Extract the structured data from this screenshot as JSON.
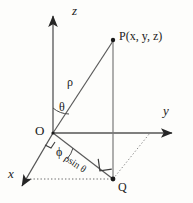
{
  "diagram": {
    "background_color": "#fdfdfb",
    "stroke_color": "#3a3a3a",
    "text_color": "#1a1a1a",
    "axes": [
      {
        "name": "z-axis",
        "label": "z",
        "direction": "up"
      },
      {
        "name": "y-axis",
        "label": "y",
        "direction": "right"
      },
      {
        "name": "x-axis",
        "label": "x",
        "direction": "down-left"
      }
    ],
    "points": [
      {
        "name": "origin",
        "label": "O"
      },
      {
        "name": "point-p",
        "label": "P(x, y, z)"
      },
      {
        "name": "point-q",
        "label": "Q"
      }
    ],
    "segments": [
      {
        "name": "rho-segment",
        "label": "ρ"
      },
      {
        "name": "rho-sin-theta-segment",
        "label": "ρsin θ"
      }
    ],
    "angles": [
      {
        "name": "theta-angle",
        "label": "θ",
        "between": "z-axis and rho"
      },
      {
        "name": "phi-angle",
        "label": "ϕ",
        "between": "x-axis and projection"
      }
    ]
  }
}
